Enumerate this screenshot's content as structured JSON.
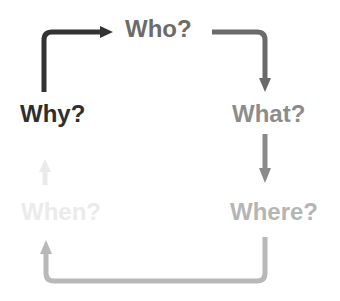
{
  "diagram": {
    "type": "cycle",
    "nodes": [
      {
        "id": "why",
        "label": "Why?",
        "color": "#2e2e2e",
        "x": 20,
        "y": 100
      },
      {
        "id": "who",
        "label": "Who?",
        "color": "#6b6b6b",
        "x": 125,
        "y": 15
      },
      {
        "id": "what",
        "label": "What?",
        "color": "#8c8c8c",
        "x": 232,
        "y": 100
      },
      {
        "id": "where",
        "label": "Where?",
        "color": "#b5b5b5",
        "x": 230,
        "y": 198
      },
      {
        "id": "when",
        "label": "When?",
        "color": "#ebebeb",
        "x": 21,
        "y": 198
      }
    ],
    "edges": [
      {
        "from": "why",
        "to": "who",
        "color": "#333333"
      },
      {
        "from": "who",
        "to": "what",
        "color": "#6a6a6a"
      },
      {
        "from": "what",
        "to": "where",
        "color": "#8a8a8a"
      },
      {
        "from": "where",
        "to": "when",
        "color": "#b8b8b8"
      },
      {
        "from": "when",
        "to": "why",
        "color": "#eaeaea"
      }
    ]
  }
}
